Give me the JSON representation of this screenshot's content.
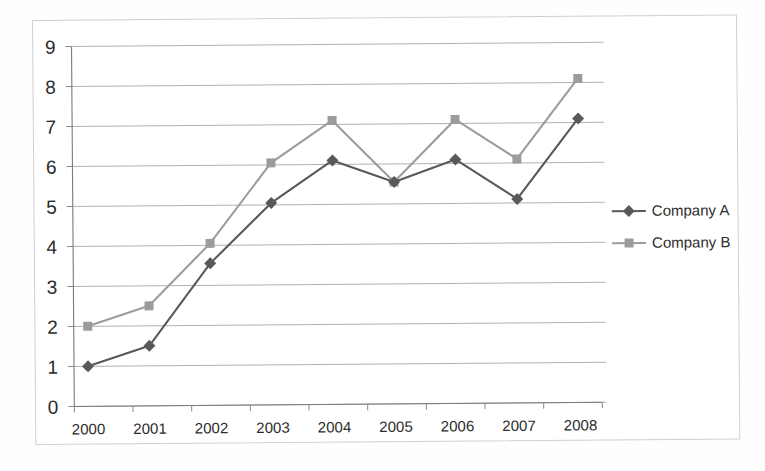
{
  "chart_data": {
    "type": "line",
    "title": "",
    "xlabel": "",
    "ylabel": "",
    "categories": [
      "2000",
      "2001",
      "2002",
      "2003",
      "2004",
      "2005",
      "2006",
      "2007",
      "2008"
    ],
    "series": [
      {
        "name": "Company A",
        "marker": "diamond",
        "color": "#595959",
        "values": [
          1.0,
          1.5,
          3.55,
          5.05,
          6.1,
          5.55,
          6.1,
          5.1,
          7.1
        ]
      },
      {
        "name": "Company B",
        "marker": "square",
        "color": "#9c9c9c",
        "values": [
          2.0,
          2.5,
          4.05,
          6.05,
          7.1,
          5.55,
          7.1,
          6.1,
          8.1
        ]
      }
    ],
    "ylim": [
      0,
      9
    ],
    "yticks": [
      0,
      1,
      2,
      3,
      4,
      5,
      6,
      7,
      8,
      9
    ],
    "ytick_labels": [
      "0",
      "1",
      "2",
      "3",
      "4",
      "5",
      "6",
      "7",
      "8",
      "9"
    ],
    "grid": true,
    "grid_axis": "y",
    "legend_position": "right"
  },
  "axes": {
    "y_labels": [
      "9",
      "8",
      "7",
      "6",
      "5",
      "4",
      "3",
      "2",
      "1",
      "0"
    ],
    "x_labels": [
      "2000",
      "2001",
      "2002",
      "2003",
      "2004",
      "2005",
      "2006",
      "2007",
      "2008"
    ]
  },
  "legend": {
    "entries": [
      {
        "label": "Company A",
        "color": "#595959",
        "marker": "diamond"
      },
      {
        "label": "Company B",
        "color": "#9c9c9c",
        "marker": "square"
      }
    ]
  },
  "colors": {
    "series_a": "#595959",
    "series_b": "#9c9c9c",
    "gridline": "#a9a9a9",
    "axis": "#7a7a7a",
    "frame": "#cfcfcf",
    "text": "#2b2b2b",
    "background": "#ffffff"
  }
}
